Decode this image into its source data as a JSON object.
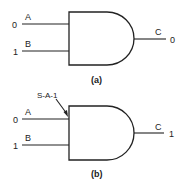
{
  "diagrams": [
    {
      "caption": "(a)",
      "gate_type": "AND",
      "inputs": [
        {
          "name": "A",
          "value": "0"
        },
        {
          "name": "B",
          "value": "1"
        }
      ],
      "output": {
        "name": "C",
        "value": "0"
      }
    },
    {
      "caption": "(b)",
      "gate_type": "AND",
      "fault_label": "S-A-1",
      "inputs": [
        {
          "name": "A",
          "value": "0"
        },
        {
          "name": "B",
          "value": "1"
        }
      ],
      "output": {
        "name": "C",
        "value": "1"
      }
    }
  ],
  "colors": {
    "stroke": "#222222",
    "background": "#ffffff"
  }
}
